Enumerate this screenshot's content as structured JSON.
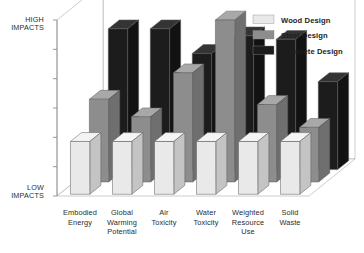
{
  "chart_data": {
    "type": "bar",
    "title": "",
    "subtitle": "",
    "xlabel": "",
    "ylabel": "Impacts",
    "projection": "3d-isometric",
    "grid": false,
    "legend_position": "top-right",
    "axis": {
      "high_label_line1": "HIGH",
      "high_label_line2": "IMPACTS",
      "low_label_line1": "LOW",
      "low_label_line2": "IMPACTS",
      "tick_count": 7,
      "tick_labels": [],
      "ylim": [
        0,
        100
      ]
    },
    "categories": [
      {
        "line1": "Embodied",
        "line2": "Energy",
        "line3": ""
      },
      {
        "line1": "Global",
        "line2": "Warming",
        "line3": "Potential"
      },
      {
        "line1": "Air",
        "line2": "Toxicity",
        "line3": ""
      },
      {
        "line1": "Water",
        "line2": "Toxicity",
        "line3": ""
      },
      {
        "line1": "Weighted",
        "line2": "Resource",
        "line3": "Use"
      },
      {
        "line1": "Solid",
        "line2": "Waste",
        "line3": ""
      }
    ],
    "series": [
      {
        "name": "Wood Design",
        "color": "#e9e9e9",
        "side": "#c4c4c4",
        "top": "#f4f4f4",
        "values": [
          30,
          30,
          30,
          30,
          30,
          30
        ]
      },
      {
        "name": "Steel Design",
        "color": "#8d8d8d",
        "side": "#6f6f6f",
        "top": "#a8a8a8",
        "values": [
          47,
          37,
          62,
          92,
          44,
          31
        ]
      },
      {
        "name": "Concrete Design",
        "color": "#1c1c1c",
        "side": "#121212",
        "top": "#343434",
        "values": [
          80,
          80,
          66,
          76,
          74,
          50
        ]
      }
    ]
  },
  "legend": {
    "items": [
      {
        "label": "Wood Design"
      },
      {
        "label": "Steel Design"
      },
      {
        "label": "Concrete Design"
      }
    ]
  }
}
